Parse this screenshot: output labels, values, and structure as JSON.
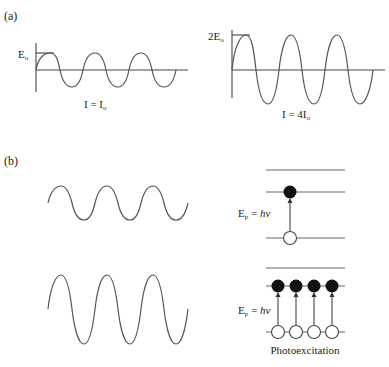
{
  "panel_a": {
    "label": "(a)",
    "left": {
      "amp_label": "E",
      "amp_sub": "o",
      "intensity": "I = I",
      "intensity_sub": "o"
    },
    "right": {
      "amp_label": "2E",
      "amp_sub": "o",
      "intensity": "I = 4I",
      "intensity_sub": "o"
    }
  },
  "panel_b": {
    "label": "(b)",
    "top": {
      "photon_label": "E",
      "photon_sub": "p",
      "photon_eq": " = ",
      "photon_h": "hν",
      "excited_electrons": 1
    },
    "bottom": {
      "photon_label": "E",
      "photon_sub": "p",
      "photon_eq": " = ",
      "photon_h": "hν",
      "excited_electrons": 4
    },
    "caption": "Photoexcitation"
  }
}
